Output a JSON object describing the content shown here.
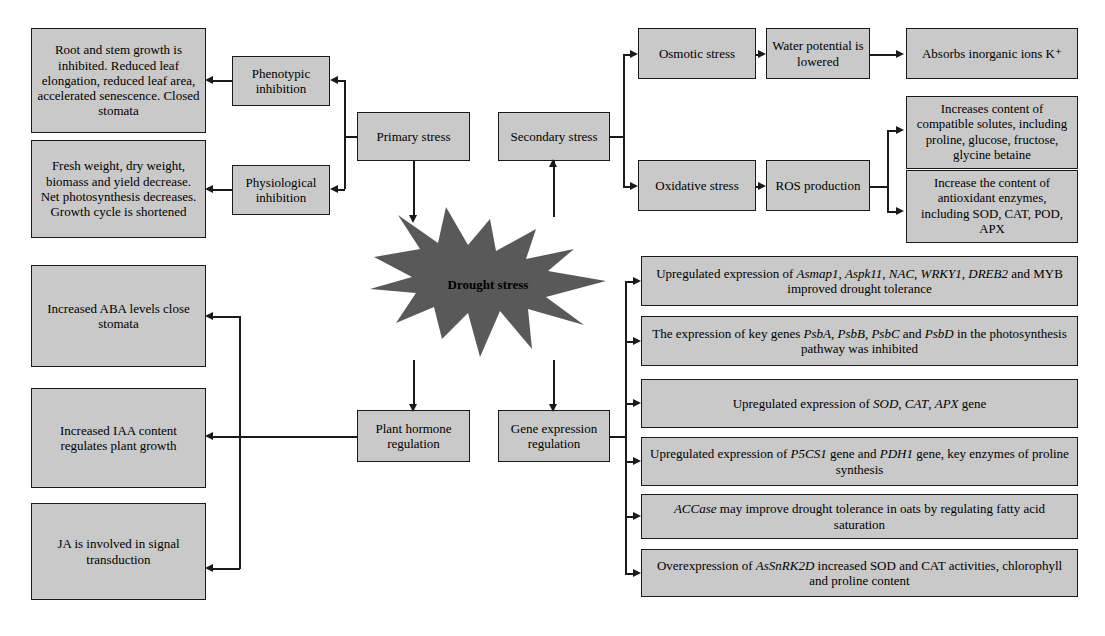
{
  "diagram": {
    "title": "Drought stress",
    "center_label": "Drought stress",
    "colors": {
      "box_fill": "#c9c9c9",
      "box_border": "#1a1a1a",
      "burst_fill": "#595959",
      "text": "#000000"
    }
  },
  "left_effects": [
    {
      "id": "phenotypic-effects",
      "text": "Root and stem growth is inhibited. Reduced leaf elongation, reduced leaf area, accelerated senescence. Closed stomata"
    },
    {
      "id": "physiological-effects",
      "text": "Fresh weight, dry weight, biomass and yield decrease. Net photosynthesis decreases. Growth cycle is shortened"
    }
  ],
  "inhibition_nodes": [
    {
      "id": "phenotypic-inhibition",
      "text": "Phenotypic inhibition"
    },
    {
      "id": "physiological-inhibition",
      "text": "Physiological inhibition"
    }
  ],
  "stress_nodes": [
    {
      "id": "primary-stress",
      "text": "Primary stress"
    },
    {
      "id": "secondary-stress",
      "text": "Secondary stress"
    }
  ],
  "stress_types": [
    {
      "id": "osmotic-stress",
      "text": "Osmotic stress"
    },
    {
      "id": "oxidative-stress",
      "text": "Oxidative stress"
    }
  ],
  "stress_mechanisms": [
    {
      "id": "water-potential",
      "text": "Water potential is lowered"
    },
    {
      "id": "ros-production",
      "text": "ROS production"
    }
  ],
  "stress_outcomes": [
    {
      "id": "absorbs-ions",
      "text": "Absorbs inorganic ions K⁺"
    },
    {
      "id": "compatible-solutes",
      "text": "Increases content of compatible solutes, including proline, glucose, fructose, glycine betaine"
    },
    {
      "id": "antioxidant-enzymes",
      "text": "Increase the content of antioxidant enzymes, including SOD, CAT, POD, APX"
    }
  ],
  "regulation_nodes": [
    {
      "id": "plant-hormone-regulation",
      "text": "Plant hormone regulation"
    },
    {
      "id": "gene-expression-regulation",
      "text": "Gene expression regulation"
    }
  ],
  "hormone_effects": [
    {
      "id": "aba-effect",
      "text": "Increased ABA levels close stomata"
    },
    {
      "id": "iaa-effect",
      "text": "Increased IAA content regulates plant growth"
    },
    {
      "id": "ja-effect",
      "text": "JA is involved in signal transduction"
    }
  ],
  "gene_effects": [
    {
      "id": "gene-effect-1",
      "html": "Upregulated expression of <i>Asmap1</i>, <i>Aspk11</i>, <i>NAC</i>, <i>WRKY1</i>, <i>DREB2</i> and MYB improved drought tolerance",
      "text": "Upregulated expression of Asmap1, Aspk11, NAC, WRKY1, DREB2 and MYB improved drought tolerance"
    },
    {
      "id": "gene-effect-2",
      "html": "The expression of key genes <i>PsbA</i>, <i>PsbB</i>, <i>PsbC</i> and <i>PsbD</i> in the photosynthesis pathway was inhibited",
      "text": "The expression of key genes PsbA, PsbB, PsbC and PsbD in the photosynthesis pathway was inhibited"
    },
    {
      "id": "gene-effect-3",
      "html": "Upregulated expression of <i>SOD</i>, <i>CAT</i>, <i>APX</i> gene",
      "text": "Upregulated expression of SOD, CAT, APX gene"
    },
    {
      "id": "gene-effect-4",
      "html": "Upregulated expression of <i>P5CS1</i> gene and <i>PDH1</i> gene, key enzymes of proline synthesis",
      "text": "Upregulated expression of P5CS1 gene and PDH1 gene, key enzymes of proline synthesis"
    },
    {
      "id": "gene-effect-5",
      "html": "<i>ACCase</i> may improve drought tolerance in oats by regulating fatty acid saturation",
      "text": "ACCase may improve drought tolerance in oats by regulating fatty acid saturation"
    },
    {
      "id": "gene-effect-6",
      "html": "Overexpression of <i>AsSnRK2D</i> increased SOD and CAT activities, chlorophyll and proline content",
      "text": "Overexpression of AsSnRK2D increased SOD and CAT activities, chlorophyll and proline content"
    }
  ]
}
